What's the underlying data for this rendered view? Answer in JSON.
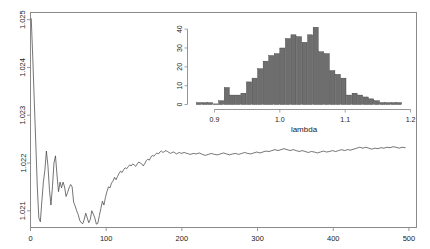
{
  "figure": {
    "background": "#ffffff",
    "line_color": "#3a3a3a",
    "frame_color": "#8a8a8a",
    "bar_color": "#6e6e6e",
    "bar_edge": "#3a3a3a"
  },
  "chart_data": [
    {
      "id": "main-trace",
      "type": "line",
      "title": "",
      "xlabel": "",
      "ylabel": "",
      "xlim": [
        0,
        510
      ],
      "ylim": [
        1.02065,
        1.02515
      ],
      "xticks": [
        0,
        100,
        200,
        300,
        400,
        500
      ],
      "xticklabels": [
        "0",
        "100",
        "200",
        "300",
        "400",
        "500"
      ],
      "yticks": [
        1.021,
        1.022,
        1.023,
        1.024,
        1.025
      ],
      "yticklabels": [
        "1.021",
        "1.022",
        "1.023",
        "1.024",
        "1.025"
      ],
      "grid": false,
      "legend": "none",
      "x": [
        1,
        3,
        5,
        7,
        9,
        11,
        13,
        15,
        17,
        19,
        21,
        23,
        25,
        27,
        29,
        31,
        33,
        35,
        37,
        39,
        41,
        43,
        45,
        47,
        49,
        51,
        53,
        55,
        57,
        59,
        61,
        63,
        65,
        67,
        69,
        71,
        73,
        75,
        77,
        79,
        81,
        83,
        85,
        87,
        89,
        91,
        93,
        95,
        97,
        99,
        101,
        103,
        105,
        107,
        109,
        111,
        113,
        115,
        117,
        119,
        121,
        123,
        125,
        127,
        129,
        131,
        133,
        135,
        137,
        139,
        141,
        143,
        145,
        147,
        149,
        151,
        153,
        155,
        157,
        159,
        161,
        163,
        165,
        167,
        169,
        171,
        173,
        175,
        177,
        179,
        181,
        183,
        185,
        187,
        189,
        191,
        193,
        195,
        197,
        199,
        203,
        207,
        211,
        215,
        219,
        223,
        227,
        231,
        235,
        239,
        243,
        247,
        251,
        255,
        259,
        263,
        267,
        271,
        275,
        279,
        283,
        287,
        291,
        295,
        299,
        303,
        307,
        311,
        315,
        319,
        323,
        327,
        331,
        335,
        339,
        343,
        347,
        351,
        355,
        359,
        363,
        367,
        371,
        375,
        379,
        383,
        387,
        391,
        395,
        399,
        403,
        407,
        411,
        415,
        419,
        423,
        427,
        431,
        435,
        439,
        443,
        447,
        451,
        455,
        459,
        463,
        467,
        471,
        475,
        479,
        483,
        487,
        491,
        495,
        499
      ],
      "y": [
        1.02502,
        1.0242,
        1.0233,
        1.0224,
        1.0215,
        1.02085,
        1.02077,
        1.0212,
        1.0216,
        1.02185,
        1.02225,
        1.02195,
        1.02145,
        1.02112,
        1.0215,
        1.022,
        1.02215,
        1.02175,
        1.0214,
        1.0216,
        1.02148,
        1.0216,
        1.0215,
        1.0213,
        1.02138,
        1.02148,
        1.02155,
        1.0215,
        1.02118,
        1.0211,
        1.021,
        1.02092,
        1.0208,
        1.02075,
        1.02073,
        1.02082,
        1.02095,
        1.02085,
        1.02075,
        1.02082,
        1.021,
        1.02093,
        1.02085,
        1.02072,
        1.02074,
        1.0209,
        1.02105,
        1.0212,
        1.02112,
        1.02128,
        1.0214,
        1.0215,
        1.02148,
        1.02158,
        1.02162,
        1.0217,
        1.02165,
        1.02172,
        1.02178,
        1.02183,
        1.0218,
        1.02186,
        1.0219,
        1.02188,
        1.02192,
        1.02196,
        1.02194,
        1.02198,
        1.02196,
        1.02193,
        1.02198,
        1.02202,
        1.022,
        1.02198,
        1.02194,
        1.02199,
        1.02205,
        1.02208,
        1.02206,
        1.02212,
        1.02216,
        1.02214,
        1.02218,
        1.02221,
        1.02219,
        1.02223,
        1.02225,
        1.02222,
        1.02224,
        1.02226,
        1.02224,
        1.02222,
        1.0222,
        1.02222,
        1.02223,
        1.02221,
        1.02219,
        1.02221,
        1.02222,
        1.0222,
        1.02222,
        1.0222,
        1.02218,
        1.0222,
        1.02219,
        1.02221,
        1.02218,
        1.02216,
        1.02218,
        1.0222,
        1.02218,
        1.02217,
        1.02219,
        1.02221,
        1.02219,
        1.02217,
        1.02219,
        1.0222,
        1.02218,
        1.0222,
        1.02222,
        1.0222,
        1.02219,
        1.02221,
        1.02223,
        1.02221,
        1.02223,
        1.02225,
        1.02224,
        1.02226,
        1.02228,
        1.02226,
        1.02228,
        1.0223,
        1.02228,
        1.02226,
        1.02228,
        1.02226,
        1.02224,
        1.02226,
        1.02224,
        1.02222,
        1.02224,
        1.02223,
        1.02221,
        1.02223,
        1.02225,
        1.02223,
        1.02224,
        1.02226,
        1.02224,
        1.02226,
        1.02228,
        1.02226,
        1.02228,
        1.02227,
        1.02229,
        1.02231,
        1.02233,
        1.02231,
        1.02233,
        1.02231,
        1.02229,
        1.02231,
        1.0223,
        1.02232,
        1.02231,
        1.02233,
        1.02232,
        1.02234,
        1.02233,
        1.02231,
        1.02233,
        1.02232
      ]
    },
    {
      "id": "inset-histogram",
      "type": "bar",
      "title": "",
      "xlabel": "lambda",
      "ylabel": "",
      "xlim": [
        0.868,
        1.206
      ],
      "ylim": [
        0,
        43
      ],
      "xticks": [
        0.9,
        1.0,
        1.1,
        1.2
      ],
      "xticklabels": [
        "0.9",
        "1.0",
        "1.1",
        "1.2"
      ],
      "yticks": [
        0,
        10,
        20,
        30,
        40
      ],
      "yticklabels": [
        "0",
        "10",
        "20",
        "30",
        "40"
      ],
      "grid": false,
      "legend": "none",
      "bin_width": 0.0085,
      "bin_starts": [
        0.8725,
        0.881,
        0.8895,
        0.898,
        0.9065,
        0.915,
        0.9235,
        0.932,
        0.9405,
        0.949,
        0.9575,
        0.966,
        0.9745,
        0.983,
        0.9915,
        1.0,
        1.0085,
        1.017,
        1.0255,
        1.034,
        1.0425,
        1.051,
        1.0595,
        1.068,
        1.0765,
        1.085,
        1.0935,
        1.102,
        1.1105,
        1.119,
        1.1275,
        1.136,
        1.1445,
        1.153,
        1.1615,
        1.17,
        1.1785
      ],
      "categories": [
        "0.877",
        "0.885",
        "0.894",
        "0.902",
        "0.911",
        "0.919",
        "0.928",
        "0.936",
        "0.945",
        "0.953",
        "0.962",
        "0.970",
        "0.979",
        "0.987",
        "0.996",
        "1.004",
        "1.013",
        "1.021",
        "1.030",
        "1.038",
        "1.047",
        "1.055",
        "1.064",
        "1.072",
        "1.081",
        "1.089",
        "1.098",
        "1.106",
        "1.115",
        "1.123",
        "1.132",
        "1.140",
        "1.149",
        "1.157",
        "1.166",
        "1.174",
        "1.183"
      ],
      "values": [
        1,
        1,
        1,
        0,
        2,
        9,
        5,
        5,
        6,
        12,
        14,
        19,
        23,
        26,
        27,
        30,
        35,
        37,
        36,
        33,
        37,
        41,
        28,
        27,
        18,
        16,
        14,
        5,
        6,
        5,
        4,
        3,
        2,
        1,
        1,
        1,
        1
      ]
    }
  ]
}
